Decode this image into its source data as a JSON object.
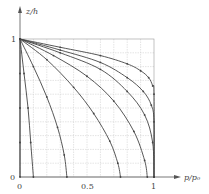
{
  "chart_data": {
    "type": "line",
    "title": "",
    "xlabel": "p/p0",
    "ylabel": "z/h",
    "xlim": [
      0,
      1.2
    ],
    "ylim": [
      0,
      1.2
    ],
    "grid": true,
    "grid_step": 0.1,
    "x_ticks": [
      "0",
      "0.5",
      "1"
    ],
    "y_ticks": [
      "0",
      "1"
    ],
    "series": [
      {
        "name": "curve-1",
        "x": [
          0,
          0,
          0,
          0,
          0
        ],
        "y": [
          1,
          0.75,
          0.5,
          0.25,
          0
        ]
      },
      {
        "name": "curve-2",
        "x": [
          0,
          0.03,
          0.06,
          0.08,
          0.1
        ],
        "y": [
          1,
          0.75,
          0.5,
          0.25,
          0
        ]
      },
      {
        "name": "curve-3",
        "x": [
          0,
          0.1,
          0.2,
          0.28,
          0.33,
          0.35
        ],
        "y": [
          1,
          0.8,
          0.58,
          0.36,
          0.16,
          0
        ]
      },
      {
        "name": "curve-4",
        "x": [
          0,
          0.2,
          0.4,
          0.55,
          0.67,
          0.73,
          0.75
        ],
        "y": [
          1,
          0.85,
          0.65,
          0.46,
          0.26,
          0.1,
          0
        ]
      },
      {
        "name": "curve-5",
        "x": [
          0,
          0.25,
          0.5,
          0.7,
          0.85,
          0.93,
          0.95
        ],
        "y": [
          1,
          0.88,
          0.73,
          0.55,
          0.33,
          0.12,
          0
        ]
      },
      {
        "name": "curve-6",
        "x": [
          0,
          0.3,
          0.6,
          0.8,
          0.93,
          0.99,
          1.0
        ],
        "y": [
          1,
          0.9,
          0.78,
          0.62,
          0.45,
          0.25,
          0
        ]
      },
      {
        "name": "curve-7",
        "x": [
          0,
          0.3,
          0.6,
          0.8,
          0.92,
          0.98,
          1.0,
          1.0
        ],
        "y": [
          1,
          0.92,
          0.83,
          0.72,
          0.62,
          0.52,
          0.4,
          0
        ]
      },
      {
        "name": "curve-8",
        "x": [
          0,
          0.3,
          0.6,
          0.8,
          0.9,
          0.96,
          0.99,
          1.0,
          1.0
        ],
        "y": [
          1,
          0.94,
          0.88,
          0.82,
          0.77,
          0.72,
          0.66,
          0.6,
          0
        ]
      }
    ]
  },
  "labels": {
    "y_axis": "z/h",
    "x_axis": "p/p₀",
    "y_tick_1": "1",
    "y_tick_0": "0",
    "x_tick_0": "0",
    "x_tick_05": "0.5",
    "x_tick_1": "1"
  },
  "colors": {
    "curve": "#444444",
    "grid": "#c8c8c8",
    "axis": "#555555"
  }
}
